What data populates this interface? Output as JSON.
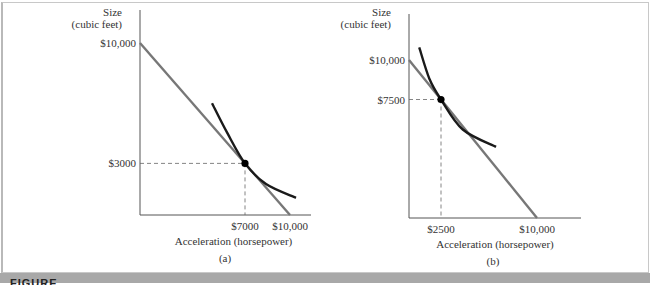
{
  "figure_caption_fragment": "FIGURE",
  "chart_data": [
    {
      "panel": "(a)",
      "type": "line",
      "ylabel": [
        "Size",
        "(cubic feet)"
      ],
      "xlabel": "Acceleration (horsepower)",
      "y_ticks": [
        {
          "value": 10000,
          "label": "$10,000"
        },
        {
          "value": 3000,
          "label": "$3000"
        }
      ],
      "x_ticks": [
        {
          "value": 7000,
          "label": "$7000"
        },
        {
          "value": 10000,
          "label": "$10,000"
        }
      ],
      "budget_line": {
        "x_intercept": 10000,
        "y_intercept": 10000
      },
      "tangency_point": {
        "x": 7000,
        "y": 3000
      },
      "indifference_curve": [
        [
          4800,
          6500
        ],
        [
          5800,
          4800
        ],
        [
          7000,
          3000
        ],
        [
          8400,
          1800
        ],
        [
          10400,
          1000
        ]
      ],
      "colors": {
        "budget_line": "#777777",
        "indifference_curve": "#1a1a1a",
        "point": "#000000"
      }
    },
    {
      "panel": "(b)",
      "type": "line",
      "ylabel": [
        "Size",
        "(cubic feet)"
      ],
      "xlabel": "Acceleration (horsepower)",
      "y_ticks": [
        {
          "value": 10000,
          "label": "$10,000"
        },
        {
          "value": 7500,
          "label": "$7500"
        }
      ],
      "x_ticks": [
        {
          "value": 2500,
          "label": "$2500"
        },
        {
          "value": 10000,
          "label": "$10,000"
        }
      ],
      "budget_line": {
        "x_intercept": 10000,
        "y_intercept": 10000
      },
      "tangency_point": {
        "x": 2500,
        "y": 7500
      },
      "indifference_curve": [
        [
          800,
          10800
        ],
        [
          1600,
          8800
        ],
        [
          2500,
          7500
        ],
        [
          4200,
          5600
        ],
        [
          6800,
          4500
        ]
      ],
      "colors": {
        "budget_line": "#777777",
        "indifference_curve": "#1a1a1a",
        "point": "#000000"
      }
    }
  ]
}
